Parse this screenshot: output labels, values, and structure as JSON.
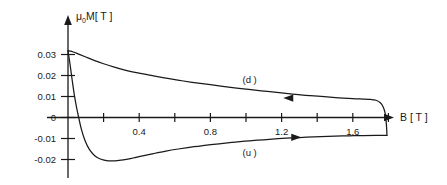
{
  "chart_data": {
    "type": "line",
    "title": "",
    "xlabel": "B [T]",
    "ylabel": "μ₀M [T]",
    "ylabel_main": "M[T]",
    "ylabel_mu": "μ",
    "ylabel_sub": "0",
    "xlim": [
      0,
      1.9
    ],
    "ylim": [
      -0.025,
      0.035
    ],
    "grid": false,
    "legend_position": "inline-annotations",
    "xticks": [
      0.2,
      0.4,
      0.6,
      0.8,
      1.0,
      1.2,
      1.4,
      1.6,
      1.8
    ],
    "xtick_labels": [
      "",
      "0.4",
      "",
      "0.8",
      "",
      "1.2",
      "",
      "1.6",
      ""
    ],
    "yticks": [
      0.03,
      0.02,
      0.01,
      0,
      -0.01,
      -0.02
    ],
    "ytick_labels": [
      "0.03",
      "0.02",
      "0.01",
      "0",
      "-0.01",
      "-0.02"
    ],
    "annotations": [
      {
        "text": "(d )",
        "x": 1.02,
        "y": 0.0183,
        "series": "down-sweep"
      },
      {
        "text": "(u )",
        "x": 1.02,
        "y": -0.0165,
        "series": "up-sweep"
      }
    ],
    "arrows": [
      {
        "series": "down-sweep",
        "x": 1.26,
        "y": 0.00925,
        "direction": "left"
      },
      {
        "series": "up-sweep",
        "x": 1.26,
        "y": -0.00945,
        "direction": "right"
      }
    ],
    "series": [
      {
        "name": "down-sweep",
        "label": "(d )",
        "color": "#1a1a1a",
        "points": [
          [
            0.0,
            0.0318
          ],
          [
            0.03,
            0.0312
          ],
          [
            0.06,
            0.0302
          ],
          [
            0.1,
            0.0288
          ],
          [
            0.15,
            0.0271
          ],
          [
            0.2,
            0.0256
          ],
          [
            0.26,
            0.024
          ],
          [
            0.32,
            0.0226
          ],
          [
            0.4,
            0.0211
          ],
          [
            0.48,
            0.0198
          ],
          [
            0.56,
            0.0186
          ],
          [
            0.64,
            0.0175
          ],
          [
            0.72,
            0.0165
          ],
          [
            0.8,
            0.0156
          ],
          [
            0.88,
            0.0147
          ],
          [
            0.96,
            0.0139
          ],
          [
            1.04,
            0.0131
          ],
          [
            1.12,
            0.0124
          ],
          [
            1.2,
            0.0117
          ],
          [
            1.28,
            0.011
          ],
          [
            1.36,
            0.0104
          ],
          [
            1.44,
            0.0099
          ],
          [
            1.52,
            0.0094
          ],
          [
            1.6,
            0.009
          ],
          [
            1.66,
            0.0088
          ],
          [
            1.7,
            0.0086
          ],
          [
            1.73,
            0.0082
          ],
          [
            1.755,
            0.007
          ],
          [
            1.772,
            0.0048
          ],
          [
            1.782,
            0.002
          ],
          [
            1.787,
            -0.0015
          ],
          [
            1.79,
            -0.005
          ],
          [
            1.792,
            -0.0085
          ]
        ]
      },
      {
        "name": "up-sweep",
        "label": "(u )",
        "color": "#1a1a1a",
        "points": [
          [
            0.0,
            0.0318
          ],
          [
            0.012,
            0.025
          ],
          [
            0.024,
            0.0175
          ],
          [
            0.036,
            0.0105
          ],
          [
            0.048,
            0.0048
          ],
          [
            0.06,
            0.0
          ],
          [
            0.075,
            -0.0055
          ],
          [
            0.095,
            -0.0108
          ],
          [
            0.12,
            -0.0152
          ],
          [
            0.15,
            -0.0182
          ],
          [
            0.185,
            -0.0199
          ],
          [
            0.225,
            -0.0206
          ],
          [
            0.265,
            -0.0206
          ],
          [
            0.31,
            -0.0202
          ],
          [
            0.36,
            -0.0194
          ],
          [
            0.42,
            -0.0183
          ],
          [
            0.48,
            -0.0172
          ],
          [
            0.55,
            -0.016
          ],
          [
            0.62,
            -0.015
          ],
          [
            0.7,
            -0.014
          ],
          [
            0.78,
            -0.0131
          ],
          [
            0.86,
            -0.0124
          ],
          [
            0.94,
            -0.0117
          ],
          [
            1.02,
            -0.0111
          ],
          [
            1.1,
            -0.0106
          ],
          [
            1.18,
            -0.0101
          ],
          [
            1.26,
            -0.0097
          ],
          [
            1.34,
            -0.0094
          ],
          [
            1.42,
            -0.0091
          ],
          [
            1.5,
            -0.0089
          ],
          [
            1.58,
            -0.0087
          ],
          [
            1.66,
            -0.0086
          ],
          [
            1.73,
            -0.0085
          ],
          [
            1.792,
            -0.0085
          ]
        ]
      }
    ]
  },
  "axis": {
    "x_title": "B [ T ]",
    "y_title_mu": "μ",
    "y_title_sub": "0",
    "y_title_rest": "M[ T ]"
  }
}
